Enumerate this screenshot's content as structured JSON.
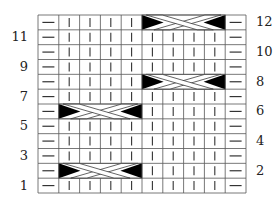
{
  "chart": {
    "title": "",
    "columns": 10,
    "rows": 12,
    "colors": {
      "line": "#555555",
      "symbol": "#333333",
      "fill": "#000000",
      "background": "#ffffff"
    },
    "left_labels": [
      {
        "row": 11,
        "text": "11"
      },
      {
        "row": 9,
        "text": "9"
      },
      {
        "row": 7,
        "text": "7"
      },
      {
        "row": 5,
        "text": "5"
      },
      {
        "row": 3,
        "text": "3"
      },
      {
        "row": 1,
        "text": "1"
      }
    ],
    "right_labels": [
      {
        "row": 12,
        "text": "12"
      },
      {
        "row": 10,
        "text": "10"
      },
      {
        "row": 8,
        "text": "8"
      },
      {
        "row": 6,
        "text": "6"
      },
      {
        "row": 4,
        "text": "4"
      },
      {
        "row": 2,
        "text": "2"
      }
    ],
    "stitch_legend": {
      "purl": "—",
      "knit": "|",
      "cable": "4-stitch cable cross"
    },
    "base_pattern": [
      "purl",
      "knit",
      "knit",
      "knit",
      "knit",
      "knit",
      "knit",
      "knit",
      "knit",
      "purl"
    ],
    "cables": [
      {
        "row": 2,
        "start_col": 2,
        "span": 4
      },
      {
        "row": 6,
        "start_col": 2,
        "span": 4
      },
      {
        "row": 8,
        "start_col": 6,
        "span": 4
      },
      {
        "row": 12,
        "start_col": 6,
        "span": 4
      }
    ]
  }
}
